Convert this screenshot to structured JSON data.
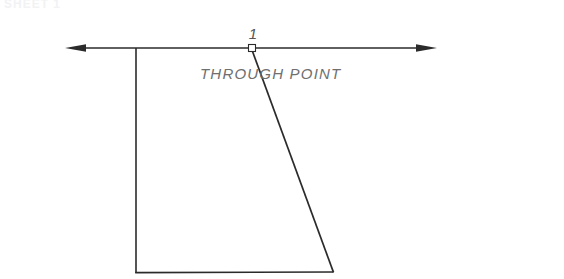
{
  "canvas": {
    "width": 564,
    "height": 279,
    "background": "#ffffff"
  },
  "colors": {
    "line": "#2b2b2b",
    "thin_line": "#3a3a3a",
    "dim_text": "#6f6f6f",
    "index_text": "#555555",
    "clipped_text": "#f2f2f4",
    "marker_stroke": "#2b2b2b",
    "marker_fill": "#ffffff"
  },
  "labels": {
    "through_point": "THROUGH  POINT",
    "point_index": "1",
    "clipped_header": "SHEET 1"
  },
  "geometry": {
    "reference_line": {
      "y": 48,
      "x_start": 65,
      "x_end": 437,
      "arrow_left": "left-arrowhead",
      "arrow_right": "right-arrowhead"
    },
    "through_point_marker": {
      "cx": 252,
      "cy": 48,
      "size": 7,
      "shape": "square"
    },
    "shape": {
      "name": "open-quadrilateral",
      "vertices": [
        {
          "x": 136,
          "y": 48
        },
        {
          "x": 136,
          "y": 273
        },
        {
          "x": 333,
          "y": 272
        },
        {
          "x": 252,
          "y": 50
        }
      ],
      "edges": [
        {
          "name": "left-vertical-edge",
          "from": 0,
          "to": 1
        },
        {
          "name": "bottom-edge",
          "from": 1,
          "to": 2
        },
        {
          "name": "slanted-right-edge",
          "from": 2,
          "to": 3
        }
      ]
    },
    "top_edge_overlap": {
      "name": "top-edge-on-reference-line",
      "x_start": 136,
      "x_end": 252,
      "y": 48
    }
  },
  "text_positions": {
    "point_index": {
      "x": 253,
      "y": 39,
      "font_size": 15
    },
    "through_point": {
      "x": 200,
      "y": 79,
      "font_size": 15
    },
    "clipped_header": {
      "x": 4,
      "y": 8,
      "font_size": 12
    }
  }
}
